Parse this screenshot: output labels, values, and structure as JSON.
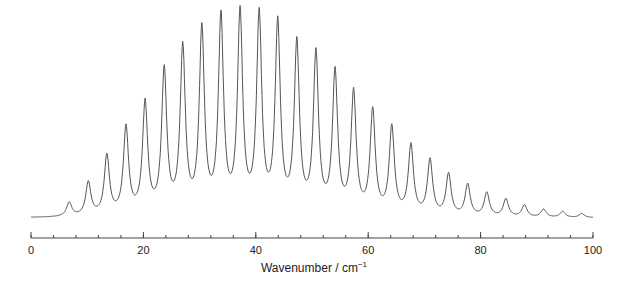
{
  "chart_data": {
    "type": "line",
    "title": "",
    "xlabel": "Wavenumber / cm",
    "xlabel_superscript": "−1",
    "ylabel": "",
    "xlim": [
      0,
      100
    ],
    "x_ticks_major": [
      0,
      20,
      40,
      60,
      80,
      100
    ],
    "x_tick_labels": [
      "0",
      "20",
      "40",
      "60",
      "80",
      "100"
    ],
    "x_minor_tick_step": 4,
    "grid": false,
    "legend": null,
    "baseline": 0.02,
    "peak_width": 0.55,
    "peaks": {
      "x": [
        6.8,
        10.2,
        13.5,
        16.9,
        20.3,
        23.7,
        27.0,
        30.4,
        33.8,
        37.2,
        40.6,
        43.9,
        47.3,
        50.7,
        54.1,
        57.4,
        60.8,
        64.2,
        67.6,
        71.0,
        74.3,
        77.7,
        81.1,
        84.5,
        87.8,
        91.2,
        94.6,
        98.0
      ],
      "y": [
        0.07,
        0.17,
        0.3,
        0.44,
        0.56,
        0.72,
        0.83,
        0.92,
        0.98,
        1.0,
        0.99,
        0.95,
        0.85,
        0.8,
        0.71,
        0.61,
        0.52,
        0.44,
        0.35,
        0.28,
        0.21,
        0.16,
        0.12,
        0.09,
        0.06,
        0.04,
        0.03,
        0.02
      ]
    }
  }
}
